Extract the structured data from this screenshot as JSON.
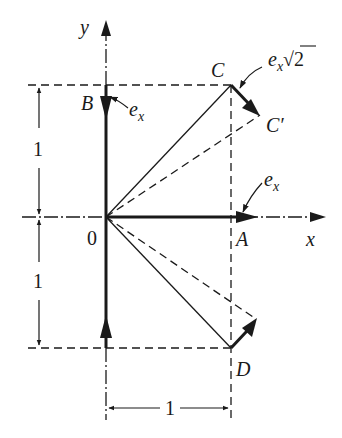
{
  "diagram": {
    "type": "vector displacement diagram",
    "axes": {
      "x_label": "x",
      "y_label": "y",
      "origin_label": "0"
    },
    "points": {
      "O": {
        "label": "0",
        "coords": [
          0,
          0
        ]
      },
      "A": {
        "label": "A",
        "coords": [
          1,
          0
        ]
      },
      "B": {
        "label": "B",
        "coords": [
          0,
          1
        ]
      },
      "C": {
        "label": "C",
        "coords": [
          1,
          1
        ]
      },
      "C_prime": {
        "label": "C′"
      },
      "D": {
        "label": "D",
        "coords": [
          1,
          -1
        ]
      }
    },
    "annotations": {
      "ex_at_B": {
        "base": "e",
        "sub": "x"
      },
      "ex_at_A": {
        "base": "e",
        "sub": "x"
      },
      "ex_sqrt2_at_C": {
        "base": "e",
        "sub": "x",
        "suffix": "√2"
      }
    },
    "dimensions": {
      "left_upper": "1",
      "left_lower": "1",
      "bottom": "1"
    },
    "colors": {
      "ink": "#1a1a1a",
      "background": "#ffffff"
    }
  }
}
